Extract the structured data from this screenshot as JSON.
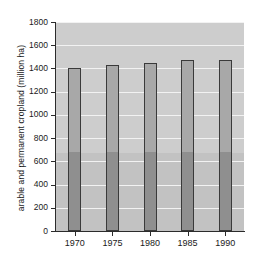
{
  "chart_data": {
    "type": "bar",
    "title": "",
    "xlabel": "",
    "ylabel": "arable and permanent cropland (million ha)",
    "categories": [
      "1970",
      "1975",
      "1980",
      "1985",
      "1990"
    ],
    "values": [
      1405,
      1430,
      1450,
      1472,
      1472
    ],
    "series": [
      {
        "name": "arable and permanent cropland",
        "values": [
          1405,
          1430,
          1450,
          1472,
          1472
        ]
      }
    ],
    "ylim": [
      0,
      1800
    ],
    "xlim_categories": 5,
    "yticks": [
      0,
      200,
      400,
      600,
      800,
      1000,
      1200,
      1400,
      1600,
      1800
    ],
    "ytick_labels": [
      "0",
      "200",
      "400",
      "600",
      "800",
      "1000",
      "1200",
      "1400",
      "1600",
      "1800"
    ],
    "grid": true,
    "grid_axis": "y",
    "legend": false,
    "legend_position": "none",
    "shading_break_value": 670,
    "colors": {
      "bar_upper": "#a8a8a8",
      "bar_lower": "#8f8f8f",
      "bar_edge": "#3a3a3a",
      "plot_background_upper": "#cdcdcd",
      "plot_background_lower": "#c2c2c2",
      "gridline": "#f2f2f2",
      "axis": "#2b2b2b",
      "text": "#1a1a1a",
      "figure_background": "#ffffff"
    }
  }
}
